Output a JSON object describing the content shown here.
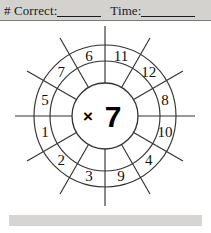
{
  "worksheet": {
    "header": {
      "correct_label": "# Correct:",
      "correct_blank_value": "",
      "time_label": "Time:",
      "time_blank_value": ""
    },
    "wheel": {
      "center_operator": "×",
      "center_multiplier": "7",
      "center_text": "×7",
      "sector_count": 12,
      "numbers": [
        "11",
        "12",
        "8",
        "10",
        "4",
        "9",
        "3",
        "2",
        "1",
        "5",
        "7",
        "6"
      ],
      "sectors": [
        {
          "label": "11",
          "angle_deg": -75
        },
        {
          "label": "12",
          "angle_deg": -45
        },
        {
          "label": "8",
          "angle_deg": -15
        },
        {
          "label": "10",
          "angle_deg": 15
        },
        {
          "label": "4",
          "angle_deg": 45
        },
        {
          "label": "9",
          "angle_deg": 75
        },
        {
          "label": "3",
          "angle_deg": 105
        },
        {
          "label": "2",
          "angle_deg": 135
        },
        {
          "label": "1",
          "angle_deg": 165
        },
        {
          "label": "5",
          "angle_deg": 195
        },
        {
          "label": "7",
          "angle_deg": 225
        },
        {
          "label": "6",
          "angle_deg": 255
        }
      ]
    },
    "colors": {
      "band": "#d4d2cf",
      "footer_band": "#d7d5d2",
      "ink": "#1b1b1b",
      "line": "#333333",
      "rule": "#7d7b79"
    }
  }
}
